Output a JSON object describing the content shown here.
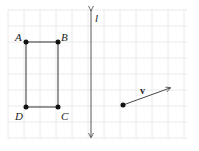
{
  "diagram": {
    "type": "geometry-grid",
    "grid": {
      "x0": 8,
      "y0": 10,
      "x1": 187,
      "y1": 138,
      "spacing": 16,
      "color": "#e2e2e2"
    },
    "rectangle": {
      "vertices": [
        {
          "label": "A",
          "x": 26,
          "y": 42
        },
        {
          "label": "B",
          "x": 58,
          "y": 42
        },
        {
          "label": "C",
          "x": 58,
          "y": 107
        },
        {
          "label": "D",
          "x": 26,
          "y": 107
        }
      ]
    },
    "line": {
      "label": "l",
      "x": 91,
      "y_top": 8,
      "y_bottom": 138
    },
    "vector": {
      "label": "v",
      "from": {
        "x": 123,
        "y": 105
      },
      "to": {
        "x": 171,
        "y": 88
      }
    }
  },
  "labels": {
    "A": "A",
    "B": "B",
    "C": "C",
    "D": "D",
    "l": "l",
    "v": "v"
  }
}
